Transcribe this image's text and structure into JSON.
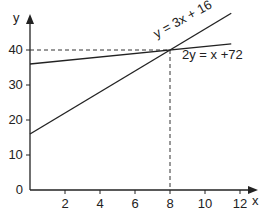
{
  "chart_data": {
    "type": "line",
    "title": "",
    "xlabel": "x",
    "ylabel": "y",
    "xlim": [
      0,
      13
    ],
    "ylim": [
      0,
      50
    ],
    "x_ticks": [
      2,
      4,
      6,
      8,
      10,
      12
    ],
    "y_ticks": [
      0,
      10,
      20,
      30,
      40
    ],
    "x_tick_labels": [
      "2",
      "4",
      "6",
      "8",
      "10",
      "12"
    ],
    "y_tick_labels": [
      "0",
      "10",
      "20",
      "30",
      "40"
    ],
    "grid": false,
    "series": [
      {
        "name": "y = 3x + 16",
        "x": [
          0,
          11.5
        ],
        "y": [
          16,
          50.5
        ]
      },
      {
        "name": "2y = x +72",
        "x": [
          0,
          11.5
        ],
        "y": [
          36,
          41.75
        ]
      }
    ],
    "annotations": [
      {
        "type": "intersection",
        "x": 8,
        "y": 40,
        "style": "dashed guide lines to axes"
      }
    ]
  },
  "labels": {
    "line1": "y = 3x + 16",
    "line2": "2y = x +72",
    "x_axis": "x",
    "y_axis": "y",
    "origin": "0"
  }
}
